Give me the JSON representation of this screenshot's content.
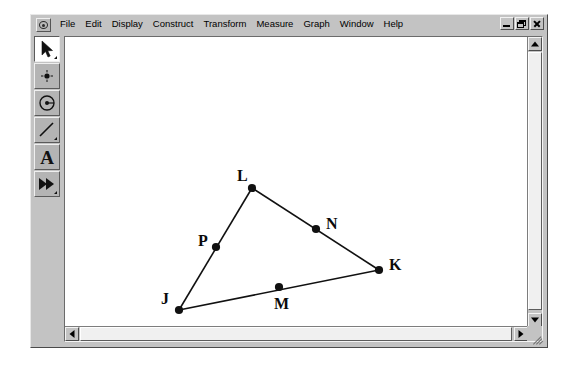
{
  "window": {
    "app_icon": "sketchpad-app-icon",
    "controls": [
      {
        "name": "minimize",
        "symbol": "_"
      },
      {
        "name": "restore",
        "symbol": "❐"
      },
      {
        "name": "close",
        "symbol": "✕"
      }
    ]
  },
  "menubar": {
    "items": [
      {
        "label": "File"
      },
      {
        "label": "Edit"
      },
      {
        "label": "Display"
      },
      {
        "label": "Construct"
      },
      {
        "label": "Transform"
      },
      {
        "label": "Measure"
      },
      {
        "label": "Graph"
      },
      {
        "label": "Window"
      },
      {
        "label": "Help"
      }
    ]
  },
  "toolbar": {
    "tools": [
      {
        "name": "selection-arrow-tool",
        "icon": "arrow-icon",
        "selected": true,
        "has_flyout": true
      },
      {
        "name": "point-tool",
        "icon": "point-icon",
        "selected": false,
        "has_flyout": false
      },
      {
        "name": "compass-circle-tool",
        "icon": "circle-icon",
        "selected": false,
        "has_flyout": false
      },
      {
        "name": "straightedge-tool",
        "icon": "line-segment-icon",
        "selected": false,
        "has_flyout": true
      },
      {
        "name": "text-tool",
        "icon": "letter-a-icon",
        "selected": false,
        "has_flyout": false
      },
      {
        "name": "custom-tool",
        "icon": "double-arrow-icon",
        "selected": false,
        "has_flyout": true
      }
    ]
  },
  "sketch": {
    "background": "#ffffff",
    "stroke_color": "#111111",
    "points": [
      {
        "label": "L",
        "x": 187,
        "y": 151,
        "label_x": 172,
        "label_y": 131
      },
      {
        "label": "P",
        "x": 151,
        "y": 210,
        "label_x": 133,
        "label_y": 196
      },
      {
        "label": "N",
        "x": 251,
        "y": 192,
        "label_x": 261,
        "label_y": 179
      },
      {
        "label": "K",
        "x": 314,
        "y": 233,
        "label_x": 324,
        "label_y": 220
      },
      {
        "label": "J",
        "x": 114,
        "y": 273,
        "label_x": 96,
        "label_y": 254
      },
      {
        "label": "M",
        "x": 214,
        "y": 250,
        "label_x": 209,
        "label_y": 259
      }
    ],
    "segments": [
      {
        "name": "segment-J-L",
        "from": "J",
        "to": "L"
      },
      {
        "name": "segment-L-K",
        "from": "L",
        "to": "K"
      },
      {
        "name": "segment-J-K",
        "from": "J",
        "to": "K"
      }
    ]
  },
  "scrollbars": {
    "vertical": {
      "up": "scroll-up-arrow",
      "down": "scroll-down-arrow"
    },
    "horizontal": {
      "left": "scroll-left-arrow",
      "right": "scroll-right-arrow"
    }
  }
}
